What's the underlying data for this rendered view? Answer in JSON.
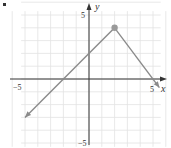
{
  "bullet": "•",
  "chart_data": {
    "type": "line",
    "title": "",
    "xlabel": "x",
    "ylabel": "y",
    "xlim": [
      -5,
      5
    ],
    "ylim": [
      -5,
      5
    ],
    "grid": true,
    "x_tick_labels": [
      "-5",
      "5"
    ],
    "y_tick_labels": [
      "5",
      "-5"
    ],
    "series": [
      {
        "name": "left ray",
        "points": [
          [
            -5,
            -3
          ],
          [
            2,
            4
          ]
        ],
        "arrow_at_start": true
      },
      {
        "name": "right ray",
        "points": [
          [
            2,
            4
          ],
          [
            5.5,
            -0.67
          ]
        ],
        "arrow_at_end": true
      }
    ],
    "marked_point": {
      "x": 2,
      "y": 4,
      "style": "filled-dot"
    },
    "colors": {
      "line": "#8a8a8a",
      "axis": "#333333",
      "grid": "#e2e2e2",
      "dot": "#9a9a9a"
    }
  },
  "labels": {
    "x_axis": "x",
    "y_axis": "y",
    "x_min": "−5",
    "x_max": "5",
    "y_max": "5",
    "y_min": "−5"
  }
}
